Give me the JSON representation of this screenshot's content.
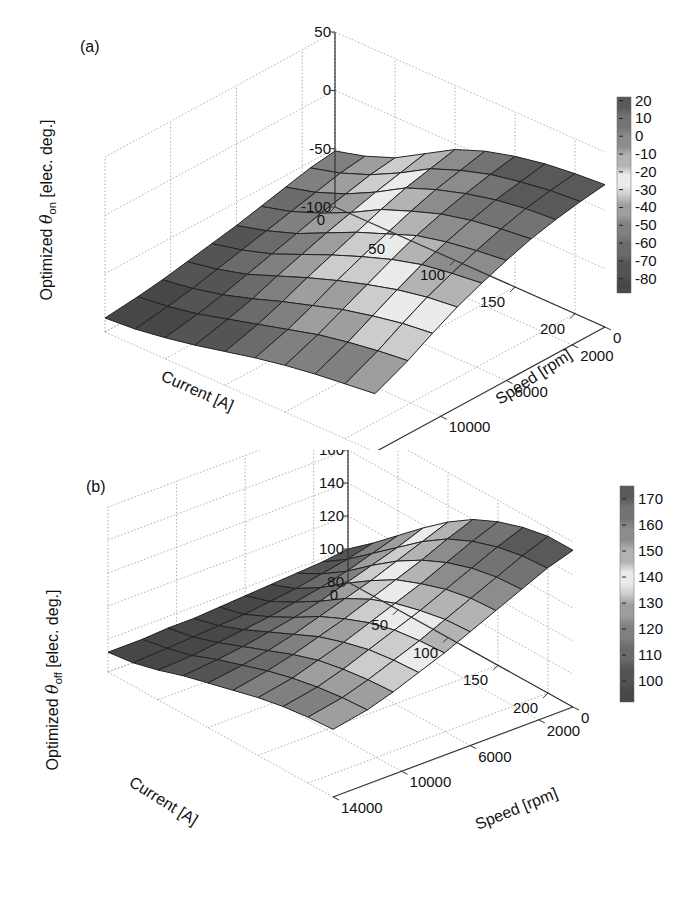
{
  "chart_data": [
    {
      "panel": "(a)",
      "type": "surface3d",
      "title": "",
      "xlabel": "Current [A]",
      "ylabel": "Speed [rpm]",
      "zlabel": "Optimized θon [elec. deg.]",
      "zlabel_parts": {
        "prefix": "Optimized ",
        "symbol": "θ",
        "sub": "on",
        "suffix": " [elec. deg.]"
      },
      "x_ticks": [
        "0",
        "50",
        "100",
        "150",
        "200"
      ],
      "y_ticks": [
        "0",
        "2000",
        "6000",
        "10000",
        "14000"
      ],
      "z_ticks": [
        "-100",
        "-50",
        "0",
        "50"
      ],
      "zlim": [
        -100,
        50
      ],
      "colorbar_ticks": [
        "20",
        "10",
        "0",
        "-10",
        "-20",
        "-30",
        "-40",
        "-50",
        "-60",
        "-70",
        "-80"
      ],
      "colorbar_range": [
        -88,
        22
      ],
      "grid": true,
      "colormap": "gray-banded",
      "x": [
        0,
        25,
        50,
        75,
        100,
        125,
        150,
        175,
        200,
        225
      ],
      "y": [
        0,
        1500,
        3000,
        4500,
        6000,
        7500,
        9000,
        10500,
        12000,
        14000
      ],
      "z": [
        [
          -52,
          -45,
          -35,
          -20,
          -5,
          5,
          12,
          17,
          20,
          22
        ],
        [
          -55,
          -48,
          -38,
          -25,
          -10,
          0,
          8,
          13,
          17,
          19
        ],
        [
          -60,
          -53,
          -43,
          -30,
          -15,
          -5,
          3,
          9,
          13,
          15
        ],
        [
          -65,
          -58,
          -48,
          -36,
          -22,
          -12,
          -3,
          3,
          7,
          10
        ],
        [
          -70,
          -63,
          -54,
          -42,
          -30,
          -20,
          -10,
          -4,
          0,
          3
        ],
        [
          -74,
          -68,
          -60,
          -49,
          -38,
          -28,
          -19,
          -12,
          -8,
          -5
        ],
        [
          -78,
          -73,
          -66,
          -56,
          -46,
          -37,
          -29,
          -22,
          -17,
          -14
        ],
        [
          -82,
          -78,
          -72,
          -64,
          -55,
          -47,
          -39,
          -33,
          -28,
          -25
        ],
        [
          -85,
          -82,
          -77,
          -70,
          -63,
          -56,
          -49,
          -44,
          -40,
          -37
        ],
        [
          -88,
          -86,
          -82,
          -77,
          -71,
          -65,
          -60,
          -56,
          -53,
          -50
        ]
      ]
    },
    {
      "panel": "(b)",
      "type": "surface3d",
      "title": "",
      "xlabel": "Current [A]",
      "ylabel": "Speed [rpm]",
      "zlabel": "Optimized θoff [elec. deg.]",
      "zlabel_parts": {
        "prefix": "Optimized ",
        "symbol": "θ",
        "sub": "off",
        "suffix": " [elec. deg.]"
      },
      "x_ticks": [
        "0",
        "50",
        "100",
        "150",
        "200"
      ],
      "y_ticks": [
        "0",
        "2000",
        "6000",
        "10000",
        "14000"
      ],
      "z_ticks": [
        "80",
        "100",
        "120",
        "140",
        "160",
        "180"
      ],
      "zlim": [
        80,
        180
      ],
      "colorbar_ticks": [
        "170",
        "160",
        "150",
        "140",
        "130",
        "120",
        "110",
        "100"
      ],
      "colorbar_range": [
        92,
        175
      ],
      "grid": true,
      "colormap": "gray-banded",
      "x": [
        0,
        25,
        50,
        75,
        100,
        125,
        150,
        175,
        200,
        225
      ],
      "y": [
        0,
        1500,
        3000,
        4500,
        6000,
        7500,
        9000,
        10500,
        12000,
        14000
      ],
      "z": [
        [
          100,
          112,
          125,
          138,
          150,
          160,
          167,
          172,
          175,
          175
        ],
        [
          98,
          108,
          120,
          132,
          144,
          154,
          161,
          166,
          169,
          170
        ],
        [
          97,
          105,
          115,
          127,
          138,
          147,
          154,
          159,
          162,
          163
        ],
        [
          96,
          102,
          111,
          122,
          132,
          141,
          147,
          152,
          155,
          156
        ],
        [
          95,
          100,
          108,
          117,
          127,
          135,
          141,
          145,
          148,
          149
        ],
        [
          94,
          98,
          105,
          113,
          122,
          129,
          135,
          139,
          141,
          142
        ],
        [
          93,
          97,
          103,
          110,
          117,
          124,
          129,
          133,
          135,
          136
        ],
        [
          93,
          96,
          101,
          107,
          113,
          119,
          124,
          127,
          129,
          130
        ],
        [
          92,
          95,
          99,
          105,
          110,
          115,
          119,
          122,
          124,
          125
        ],
        [
          92,
          94,
          98,
          103,
          107,
          111,
          115,
          118,
          120,
          121
        ]
      ]
    }
  ]
}
